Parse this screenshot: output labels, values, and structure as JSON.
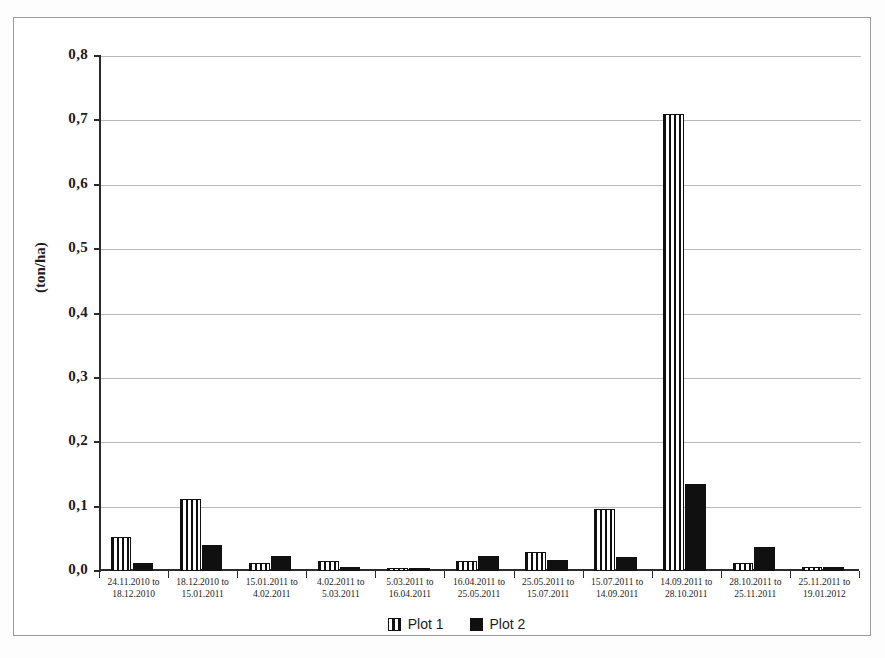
{
  "chart_data": {
    "type": "bar",
    "title": "",
    "xlabel": "",
    "ylabel": "(ton/ha)",
    "ylim": [
      0.0,
      0.8
    ],
    "ytick_labels": [
      "0,0",
      "0,1",
      "0,2",
      "0,3",
      "0,4",
      "0,5",
      "0,6",
      "0,7",
      "0,8"
    ],
    "ytick_values": [
      0.0,
      0.1,
      0.2,
      0.3,
      0.4,
      0.5,
      0.6,
      0.7,
      0.8
    ],
    "grid": true,
    "legend_position": "bottom-center",
    "categories": [
      {
        "line1": "24.11.2010 to",
        "line2": "18.12.2010"
      },
      {
        "line1": "18.12.2010 to",
        "line2": "15.01.2011"
      },
      {
        "line1": "15.01.2011 to",
        "line2": "4.02.2011"
      },
      {
        "line1": "4.02.2011 to",
        "line2": "5.03.2011"
      },
      {
        "line1": "5.03.2011 to",
        "line2": "16.04.2011"
      },
      {
        "line1": "16.04.2011 to",
        "line2": "25.05.2011"
      },
      {
        "line1": "25.05.2011 to",
        "line2": "15.07.2011"
      },
      {
        "line1": "15.07.2011 to",
        "line2": "14.09.2011"
      },
      {
        "line1": "14.09.2011 to",
        "line2": "28.10.2011"
      },
      {
        "line1": "28.10.2011 to",
        "line2": "25.11.2011"
      },
      {
        "line1": "25.11.2011 to",
        "line2": "19.01.2012"
      }
    ],
    "series": [
      {
        "name": "Plot 1",
        "fill": "white-vertical-stripes",
        "color": "#ffffff",
        "values": [
          0.053,
          0.112,
          0.013,
          0.015,
          0.004,
          0.016,
          0.029,
          0.097,
          0.71,
          0.012,
          0.007
        ]
      },
      {
        "name": "Plot 2",
        "fill": "solid",
        "color": "#101010",
        "values": [
          0.013,
          0.04,
          0.023,
          0.006,
          0.005,
          0.023,
          0.017,
          0.021,
          0.135,
          0.038,
          0.007
        ]
      }
    ]
  },
  "legend": {
    "items": [
      {
        "label": "Plot 1"
      },
      {
        "label": "Plot 2"
      }
    ]
  }
}
